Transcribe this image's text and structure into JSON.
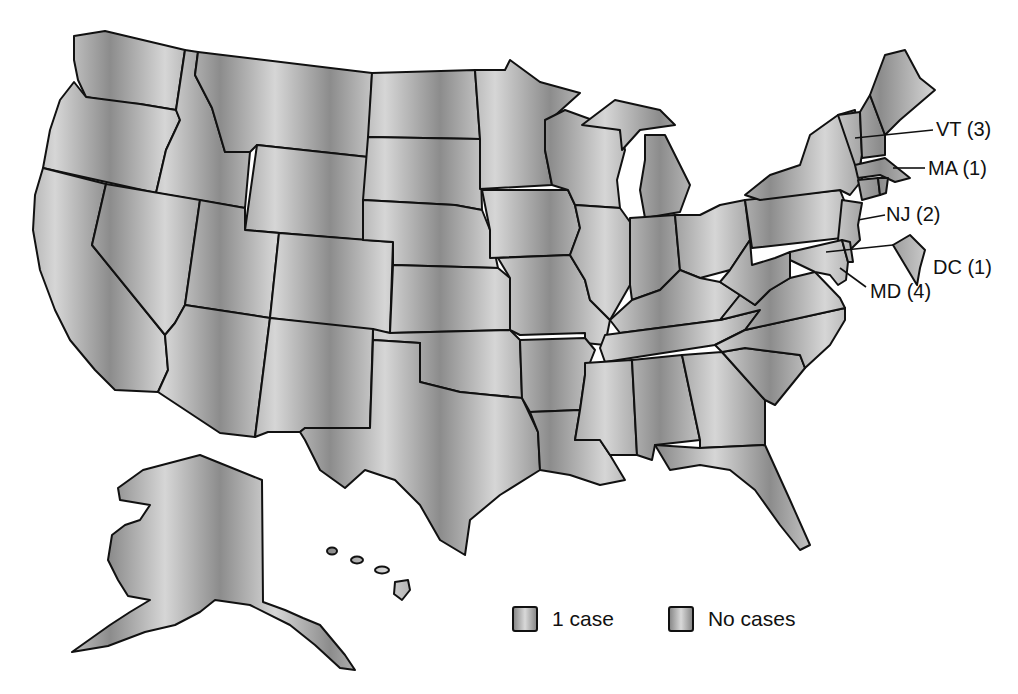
{
  "figure": {
    "type": "choropleth-map",
    "region": "United States",
    "state_fill_color": "#b3b3b3",
    "border_color": "#111111"
  },
  "callouts": [
    {
      "state": "VT",
      "count": 3,
      "label": "VT (3)"
    },
    {
      "state": "MA",
      "count": 1,
      "label": "MA (1)"
    },
    {
      "state": "NJ",
      "count": 2,
      "label": "NJ (2)"
    },
    {
      "state": "DC",
      "count": 1,
      "label": "DC (1)"
    },
    {
      "state": "MD",
      "count": 4,
      "label": "MD (4)"
    }
  ],
  "legend": {
    "items": [
      {
        "label": "1 case"
      },
      {
        "label": "No cases"
      }
    ]
  }
}
